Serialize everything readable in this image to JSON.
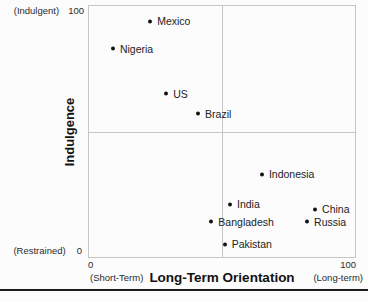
{
  "chart_data": {
    "type": "scatter",
    "title": "",
    "xlabel": "Long-Term Orientation",
    "ylabel": "Indulgence",
    "xlim": [
      0,
      100
    ],
    "ylim": [
      0,
      100
    ],
    "grid": "quadrant-midlines",
    "legend": "none",
    "point_color": "#141414",
    "x_axis": {
      "min_label": "0",
      "max_label": "100",
      "min_qualifier": "(Short-Term)",
      "max_qualifier": "(Long-term)"
    },
    "y_axis": {
      "min_label": "0",
      "max_label": "100",
      "min_qualifier": "(Restrained)",
      "max_qualifier": "(Indulgent)"
    },
    "points": [
      {
        "label": "Mexico",
        "x": 23,
        "y": 94
      },
      {
        "label": "Nigeria",
        "x": 9,
        "y": 83
      },
      {
        "label": "US",
        "x": 29,
        "y": 65
      },
      {
        "label": "Brazil",
        "x": 41,
        "y": 57
      },
      {
        "label": "Indonesia",
        "x": 65,
        "y": 33
      },
      {
        "label": "India",
        "x": 53,
        "y": 21
      },
      {
        "label": "China",
        "x": 85,
        "y": 19
      },
      {
        "label": "Bangladesh",
        "x": 46,
        "y": 14
      },
      {
        "label": "Russia",
        "x": 82,
        "y": 14
      },
      {
        "label": "Pakistan",
        "x": 51,
        "y": 5
      }
    ]
  }
}
